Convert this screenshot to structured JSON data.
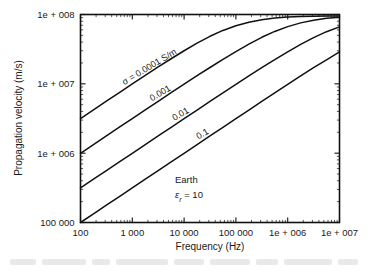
{
  "chart_data": {
    "type": "line",
    "title": "",
    "xlabel": "Frequency (Hz)",
    "ylabel": "Propagation velocity (m/s)",
    "xscale": "log",
    "yscale": "log",
    "xlim": [
      100,
      10000000
    ],
    "ylim": [
      100000,
      100000000
    ],
    "grid": false,
    "legend": "inline-curve-labels",
    "xticklabels": [
      "100",
      "1 000",
      "10 000",
      "100 000",
      "1e + 006",
      "1e + 007"
    ],
    "xtickvalues": [
      100,
      1000,
      10000,
      100000,
      1000000,
      10000000
    ],
    "yticklabels": [
      "100 000",
      "1e + 006",
      "1e + 007",
      "1e + 008"
    ],
    "ytickvalues": [
      100000,
      1000000,
      10000000,
      100000000
    ],
    "annotations": [
      {
        "text": "Earth",
        "x": 40000,
        "y": 420000
      },
      {
        "text": "ε",
        "subscript": "r",
        "suffix": " = 10",
        "x": 40000,
        "y": 250000
      }
    ],
    "series": [
      {
        "name": "σ = 0.0001 S/m",
        "label": "σ = 0.0001 S/m",
        "label_rotation": -31,
        "sigma": 0.0001,
        "x": [
          100,
          178,
          316,
          562,
          1000,
          1780,
          3160,
          5620,
          10000,
          17800,
          31600,
          56200,
          100000,
          178000,
          316000,
          562000,
          1000000,
          1780000,
          3160000,
          5620000,
          10000000
        ],
        "y": [
          3150000,
          4210000,
          5610000,
          7480000,
          9970000,
          13200000,
          17500000,
          23000000,
          30000000,
          38600000,
          48500000,
          58900000,
          68800000,
          77400000,
          84100000,
          88700000,
          91700000,
          93500000,
          94400000,
          94800000,
          95000000
        ]
      },
      {
        "name": "0.001",
        "label": "0.001",
        "label_rotation": -31,
        "sigma": 0.001,
        "x": [
          100,
          178,
          316,
          562,
          1000,
          1780,
          3160,
          5620,
          10000,
          17800,
          31600,
          56200,
          100000,
          178000,
          316000,
          562000,
          1000000,
          1780000,
          3160000,
          5620000,
          10000000
        ],
        "y": [
          997000,
          1330000,
          1770000,
          2370000,
          3150000,
          4200000,
          5600000,
          7450000,
          9900000,
          13100000,
          17200000,
          22500000,
          29200000,
          37400000,
          46900000,
          57000000,
          66900000,
          75700000,
          82900000,
          88100000,
          91600000
        ]
      },
      {
        "name": "0.01",
        "label": "0.01",
        "label_rotation": -31,
        "sigma": 0.01,
        "x": [
          100,
          178,
          316,
          562,
          1000,
          1780,
          3160,
          5620,
          10000,
          17800,
          31600,
          56200,
          100000,
          178000,
          316000,
          562000,
          1000000,
          1780000,
          3160000,
          5620000,
          10000000
        ],
        "y": [
          315000,
          421000,
          561000,
          748000,
          997000,
          1330000,
          1770000,
          2360000,
          3150000,
          4190000,
          5580000,
          7420000,
          9850000,
          13000000,
          17100000,
          22300000,
          28900000,
          37000000,
          46400000,
          56500000,
          66400000
        ]
      },
      {
        "name": "0.1",
        "label": "0.1",
        "label_rotation": -31,
        "sigma": 0.1,
        "x": [
          100,
          178,
          316,
          562,
          1000,
          1780,
          3160,
          5620,
          10000,
          17800,
          31600,
          56200,
          100000,
          178000,
          316000,
          562000,
          1000000,
          1780000,
          3160000,
          5620000,
          10000000
        ],
        "y": [
          100000,
          133000,
          178000,
          237000,
          316000,
          421000,
          561000,
          748000,
          997000,
          1330000,
          1770000,
          2360000,
          3150000,
          4190000,
          5570000,
          7410000,
          9840000,
          13000000,
          17100000,
          22200000,
          28800000
        ]
      }
    ]
  },
  "figure": {
    "background_color": "#ffffff",
    "line_color": "#111111",
    "text_color": "#1a1a1a"
  }
}
